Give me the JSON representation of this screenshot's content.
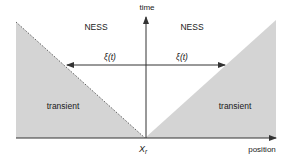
{
  "diagram": {
    "axes": {
      "y_label": "time",
      "x_label": "position",
      "origin_label": "X",
      "origin_subscript": "r"
    },
    "regions": [
      {
        "name": "ness-left",
        "label": "NESS"
      },
      {
        "name": "ness-right",
        "label": "NESS"
      },
      {
        "name": "transient-left",
        "label": "transient"
      },
      {
        "name": "transient-right",
        "label": "transient"
      }
    ],
    "arrows": [
      {
        "name": "front-left",
        "label": "ξ(t)",
        "direction": "left"
      },
      {
        "name": "front-right",
        "label": "ξ(t)",
        "direction": "right"
      }
    ],
    "colors": {
      "transient_fill": "#d4d4d4",
      "line": "#333333",
      "background": "#ffffff"
    }
  }
}
